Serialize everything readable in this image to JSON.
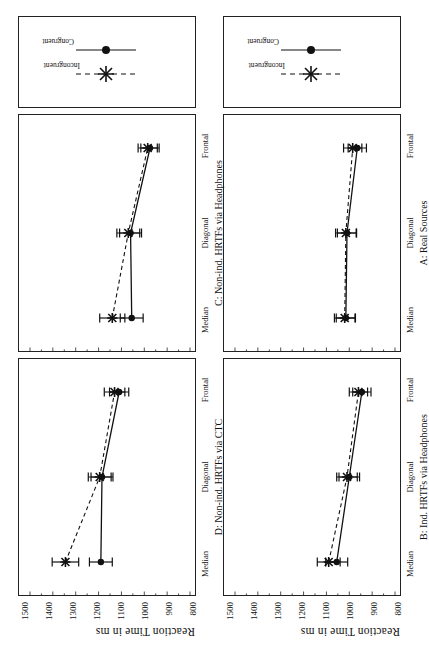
{
  "figure": {
    "y_axis_label": "Reaction Time in ms",
    "y_ticks": [
      "1500",
      "1400",
      "1300",
      "1200",
      "1100",
      "1000",
      "900",
      "800"
    ],
    "categories": [
      "Median",
      "Diagonal",
      "Frontal"
    ]
  },
  "legend": {
    "items": [
      {
        "label": "Incongruent",
        "marker": "cross-marker",
        "line": "dashed"
      },
      {
        "label": "Congruent",
        "marker": "dot-marker",
        "line": "solid"
      }
    ]
  },
  "panels": {
    "a": {
      "title": "A: Real Sources"
    },
    "b": {
      "title": "B: Ind. HRTFs via Headphones"
    },
    "c": {
      "title": "C: Non-ind. HRTFs via Headphones"
    },
    "d": {
      "title": "D: Non-ind. HRTFs via CTC"
    }
  },
  "chart_data": [
    {
      "id": "A",
      "type": "line",
      "title": "A: Real Sources",
      "xlabel": "",
      "ylabel": "Reaction Time in ms",
      "ylim": [
        800,
        1500
      ],
      "categories": [
        "Median",
        "Diagonal",
        "Frontal"
      ],
      "grid": false,
      "legend_position": "top-right-outside",
      "series": [
        {
          "name": "Congruent",
          "values": [
            1015,
            1010,
            965
          ],
          "errors": [
            42,
            42,
            40
          ]
        },
        {
          "name": "Incongruent",
          "values": [
            1020,
            1015,
            985
          ],
          "errors": [
            45,
            45,
            40
          ]
        }
      ]
    },
    {
      "id": "B",
      "type": "line",
      "title": "B: Ind. HRTFs via Headphones",
      "xlabel": "",
      "ylabel": "Reaction Time in ms",
      "ylim": [
        800,
        1500
      ],
      "categories": [
        "Median",
        "Diagonal",
        "Frontal"
      ],
      "grid": false,
      "legend_position": "top-right-outside",
      "series": [
        {
          "name": "Congruent",
          "values": [
            1055,
            1000,
            945
          ],
          "errors": [
            48,
            45,
            40
          ]
        },
        {
          "name": "Incongruent",
          "values": [
            1090,
            1010,
            960
          ],
          "errors": [
            50,
            45,
            40
          ]
        }
      ]
    },
    {
      "id": "C",
      "type": "line",
      "title": "C: Non-ind. HRTFs via Headphones",
      "xlabel": "",
      "ylabel": "Reaction Time in ms",
      "ylim": [
        800,
        1500
      ],
      "categories": [
        "Median",
        "Diagonal",
        "Frontal"
      ],
      "grid": false,
      "legend_position": "top-right-outside",
      "series": [
        {
          "name": "Congruent",
          "values": [
            1055,
            1060,
            975
          ],
          "errors": [
            50,
            48,
            40
          ]
        },
        {
          "name": "Incongruent",
          "values": [
            1140,
            1070,
            985
          ],
          "errors": [
            55,
            50,
            42
          ]
        }
      ]
    },
    {
      "id": "D",
      "type": "line",
      "title": "D: Non-ind. HRTFs via CTC",
      "xlabel": "",
      "ylabel": "Reaction Time in ms",
      "ylim": [
        800,
        1500
      ],
      "categories": [
        "Median",
        "Diagonal",
        "Frontal"
      ],
      "grid": false,
      "legend_position": "top-right-outside",
      "series": [
        {
          "name": "Congruent",
          "values": [
            1190,
            1185,
            1110
          ],
          "errors": [
            50,
            48,
            42
          ]
        },
        {
          "name": "Incongruent",
          "values": [
            1345,
            1195,
            1130
          ],
          "errors": [
            58,
            50,
            45
          ]
        }
      ]
    }
  ],
  "colors": {
    "ink": "#111111",
    "frame": "#222222",
    "background": "#ffffff"
  }
}
